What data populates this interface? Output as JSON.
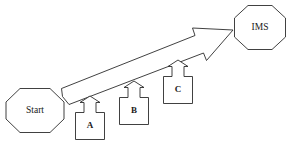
{
  "diagram": {
    "type": "process-flow",
    "background_color": "#ffffff",
    "stroke_color": "#2b2b2b",
    "fill_color": "#ffffff",
    "nodes": [
      {
        "id": "start",
        "label": "Start",
        "shape": "octagon",
        "x": 6,
        "y": 88,
        "width": 58,
        "height": 45
      },
      {
        "id": "ims",
        "label": "IMS",
        "shape": "octagon",
        "x": 234,
        "y": 5,
        "width": 52,
        "height": 45
      }
    ],
    "steps": [
      {
        "id": "step-a",
        "label": "A",
        "shape": "up-arrow-callout",
        "x": 75,
        "y": 96,
        "width": 30,
        "height": 44
      },
      {
        "id": "step-b",
        "label": "B",
        "shape": "up-arrow-callout",
        "x": 119,
        "y": 81,
        "width": 30,
        "height": 44
      },
      {
        "id": "step-c",
        "label": "C",
        "shape": "up-arrow-callout",
        "x": 163,
        "y": 60,
        "width": 30,
        "height": 44
      }
    ],
    "main_arrow": {
      "id": "main-arrow",
      "shape": "block-arrow",
      "from": "start",
      "to": "ims",
      "tail_x": 62,
      "tail_y": 96,
      "tip_x": 233,
      "tip_y": 30,
      "label": ""
    }
  }
}
